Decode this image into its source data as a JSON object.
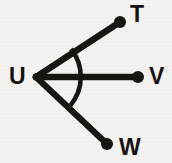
{
  "figure": {
    "background_color": "#f4f3f1",
    "ink_color": "#17140f",
    "canvas": {
      "width": 172,
      "height": 163
    },
    "vertex": {
      "label": "U",
      "x": 36,
      "y": 77,
      "label_x": 9,
      "label_y": 65
    },
    "rays": [
      {
        "name": "ray-UT",
        "label": "T",
        "from_x": 36,
        "from_y": 77,
        "to_x": 120,
        "to_y": 22,
        "endpoint_dot": true,
        "endpoint_dot_r": 6,
        "label_x": 130,
        "label_y": 3
      },
      {
        "name": "ray-UV",
        "label": "V",
        "from_x": 36,
        "from_y": 77,
        "to_x": 138,
        "to_y": 77,
        "endpoint_dot": true,
        "endpoint_dot_r": 6,
        "label_x": 149,
        "label_y": 65
      },
      {
        "name": "ray-UW",
        "label": "W",
        "from_x": 36,
        "from_y": 77,
        "to_x": 107,
        "to_y": 144,
        "endpoint_dot": true,
        "endpoint_dot_r": 6,
        "label_x": 119,
        "label_y": 136
      }
    ],
    "arc": {
      "name": "angle-arc-TUW",
      "center_x": 36,
      "center_y": 77,
      "radius": 45,
      "start_x": 71,
      "start_y": 49,
      "end_x": 70,
      "end_y": 105,
      "stroke_width": 4.6
    }
  }
}
